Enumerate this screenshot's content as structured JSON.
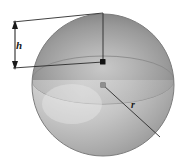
{
  "figure": {
    "type": "geometry-diagram",
    "width": 184,
    "height": 164,
    "background_color": "#ffffff"
  },
  "labels": {
    "height": "h",
    "radius": "r"
  },
  "colors": {
    "line": "#2b2b2b",
    "cap_dark": "#6f6f6f",
    "cap_light": "#c9c9c9",
    "sphere_dark": "#8d8d8d",
    "sphere_light": "#e2e2e2",
    "outline": "#7a7a7a",
    "marker": "#1a1a1a",
    "marker_light": "#9a9a9a"
  },
  "geometry": {
    "sphere_center": {
      "x": 103,
      "y": 85
    },
    "sphere_radius": 71,
    "cap_center": {
      "x": 103,
      "y": 62
    },
    "cap_top": {
      "x": 103,
      "y": 14
    },
    "cap_height_label_position": {
      "x": 19,
      "y": 48
    },
    "radius_label_position": {
      "x": 133,
      "y": 105
    },
    "radius_endpoint": {
      "x": 160,
      "y": 137
    },
    "dimension_line_x": 15,
    "dimension_top_y": 22,
    "dimension_bottom_y": 68
  },
  "annotations": {
    "height_description": "height of spherical cap",
    "radius_description": "radius of sphere"
  }
}
